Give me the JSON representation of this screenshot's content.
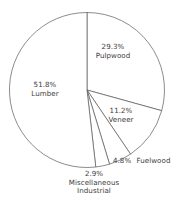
{
  "chart_data": {
    "type": "pie",
    "title": "",
    "subtitle": "",
    "xlabel": "",
    "ylabel": "",
    "legend_position": "none",
    "grid": false,
    "units": "percent",
    "start_angle_deg": 0,
    "direction": "clockwise",
    "categories": [
      "Pulpwood",
      "Veneer",
      "Fuelwood",
      "Miscellaneous Industrial",
      "Lumber"
    ],
    "values": [
      29.3,
      11.2,
      4.8,
      2.9,
      51.8
    ],
    "slices": [
      {
        "name": "Pulpwood",
        "value": 29.3,
        "percent_label": "29.3%",
        "name_line_1": "Pulpwood",
        "name_line_2": "",
        "label_placement": "inside",
        "label_layout": "stacked"
      },
      {
        "name": "Veneer",
        "value": 11.2,
        "percent_label": "11.2%",
        "name_line_1": "Veneer",
        "name_line_2": "",
        "label_placement": "inside",
        "label_layout": "stacked"
      },
      {
        "name": "Fuelwood",
        "value": 4.8,
        "percent_label": "4.8%",
        "name_line_1": "Fuelwood",
        "name_line_2": "",
        "label_placement": "outside",
        "label_layout": "inline"
      },
      {
        "name": "Miscellaneous Industrial",
        "value": 2.9,
        "percent_label": "2.9%",
        "name_line_1": "Miscellaneous",
        "name_line_2": "Industrial",
        "label_placement": "outside",
        "label_layout": "stacked"
      },
      {
        "name": "Lumber",
        "value": 51.8,
        "percent_label": "51.8%",
        "name_line_1": "Lumber",
        "name_line_2": "",
        "label_placement": "inside",
        "label_layout": "stacked"
      }
    ]
  },
  "style": {
    "slice_fill": "#ffffff",
    "outline_color": "#5a5a5a",
    "text_color": "#3c3c3c",
    "background": "#ffffff"
  }
}
